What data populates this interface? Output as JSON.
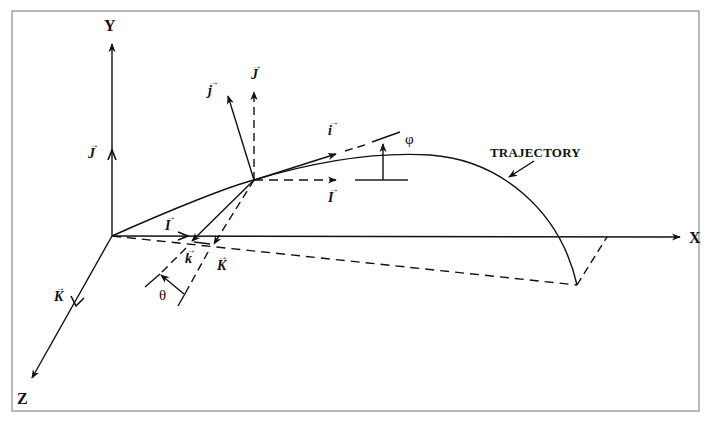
{
  "figure": {
    "type": "3D trajectory coordinate frame diagram",
    "frame_color": "#8a8a8a",
    "ink_color": "#111111"
  },
  "axes": {
    "x_label": "X",
    "y_label": "Y",
    "z_label": "Z"
  },
  "global_unit_vectors": {
    "I_on_x_axis": "I",
    "J_on_y_axis": "J",
    "K_on_z_axis": "K",
    "I_at_point": "I",
    "J_at_point": "J",
    "K_at_projection": "K"
  },
  "body_unit_vectors": {
    "i": "i",
    "j": "j",
    "k": "k"
  },
  "vector_arrow_glyph": "⃗",
  "angles": {
    "phi": "φ",
    "theta": "θ"
  },
  "annotations": {
    "trajectory": "TRAJECTORY"
  }
}
